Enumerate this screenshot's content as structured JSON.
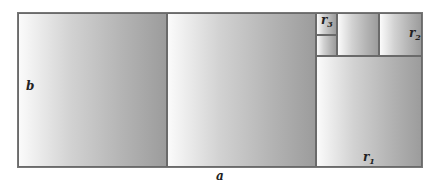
{
  "diagram": {
    "labels": {
      "b": "b",
      "a": "a",
      "r1": {
        "base": "r",
        "sub": "1"
      },
      "r2": {
        "base": "r",
        "sub": "2"
      },
      "r3": {
        "base": "r",
        "sub": "3"
      }
    },
    "squares": [
      {
        "id": "big-1",
        "x": 18,
        "y": 13,
        "w": 149,
        "h": 154
      },
      {
        "id": "big-2",
        "x": 167,
        "y": 13,
        "w": 149,
        "h": 154
      },
      {
        "id": "r1",
        "x": 316,
        "y": 56,
        "w": 106,
        "h": 111
      },
      {
        "id": "r2",
        "x": 379,
        "y": 13,
        "w": 43,
        "h": 43
      },
      {
        "id": "mid",
        "x": 337,
        "y": 13,
        "w": 42,
        "h": 43
      },
      {
        "id": "r3",
        "x": 316,
        "y": 13,
        "w": 21,
        "h": 22
      },
      {
        "id": "r3-below",
        "x": 316,
        "y": 35,
        "w": 21,
        "h": 21
      }
    ]
  }
}
